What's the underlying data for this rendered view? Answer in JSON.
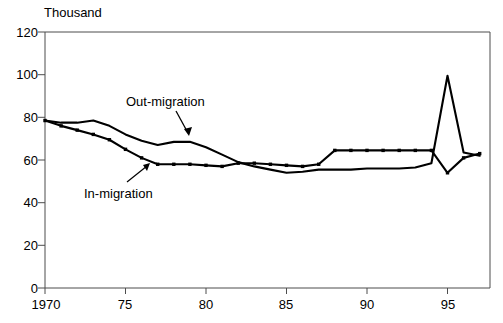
{
  "chart_data": {
    "type": "line",
    "title": "",
    "unit_label": "Thousand",
    "xlabel": "",
    "ylabel": "",
    "xlim": [
      1970,
      1997
    ],
    "ylim": [
      0,
      120
    ],
    "grid": false,
    "legend_position": "inline-annotations",
    "x_tick_labels": [
      "1970",
      "75",
      "80",
      "85",
      "90",
      "95"
    ],
    "x_tick_values": [
      1970,
      1975,
      1980,
      1985,
      1990,
      1995
    ],
    "y_tick_labels": [
      "0",
      "20",
      "40",
      "60",
      "80",
      "100",
      "120"
    ],
    "y_tick_values": [
      0,
      20,
      40,
      60,
      80,
      100,
      120
    ],
    "x": [
      1970,
      1971,
      1972,
      1973,
      1974,
      1975,
      1976,
      1977,
      1978,
      1979,
      1980,
      1981,
      1982,
      1983,
      1984,
      1985,
      1986,
      1987,
      1988,
      1989,
      1990,
      1991,
      1992,
      1993,
      1994,
      1995,
      1996,
      1997
    ],
    "series": [
      {
        "name": "Out-migration",
        "markers": false,
        "values": [
          78.5,
          77.5,
          77.5,
          78.5,
          76.0,
          72.0,
          69.0,
          67.0,
          68.5,
          68.5,
          66.0,
          62.5,
          59.0,
          57.0,
          55.5,
          54.0,
          54.5,
          55.5,
          55.5,
          55.5,
          56.0,
          56.0,
          56.0,
          56.5,
          58.5,
          99.5,
          63.5,
          62.0
        ]
      },
      {
        "name": "In-migration",
        "markers": true,
        "values": [
          78.5,
          76.0,
          74.0,
          72.0,
          69.5,
          65.0,
          61.0,
          58.0,
          58.0,
          58.0,
          57.5,
          57.0,
          58.5,
          58.5,
          58.0,
          57.5,
          57.0,
          58.0,
          64.5,
          64.5,
          64.5,
          64.5,
          64.5,
          64.5,
          64.5,
          54.0,
          61.0,
          63.0
        ]
      }
    ],
    "annotations": [
      {
        "text": "Out-migration",
        "target_series": "Out-migration"
      },
      {
        "text": "In-migration",
        "target_series": "In-migration"
      }
    ],
    "colors": {
      "line": "#000000",
      "axis": "#4d4d4d",
      "background": "#ffffff"
    }
  }
}
